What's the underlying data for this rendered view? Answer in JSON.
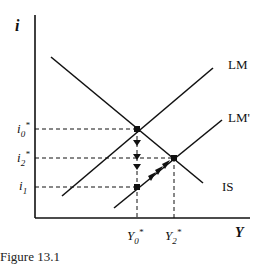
{
  "diagram": {
    "type": "IS-LM",
    "axes": {
      "y_label": "i",
      "x_label": "Y"
    },
    "curves": [
      {
        "name": "IS",
        "label": "IS"
      },
      {
        "name": "LM",
        "label": "LM"
      },
      {
        "name": "LM'",
        "label": "LM'"
      }
    ],
    "y_ticks": [
      {
        "base": "i",
        "sub": "0",
        "sup": "*"
      },
      {
        "base": "i",
        "sub": "2",
        "sup": "*"
      },
      {
        "base": "i",
        "sub": "1",
        "sup": ""
      }
    ],
    "x_ticks": [
      {
        "base": "Y",
        "sub": "0",
        "sup": "*"
      },
      {
        "base": "Y",
        "sub": "2",
        "sup": "*"
      }
    ],
    "points": [
      {
        "name": "initial-equilibrium",
        "at": "Y0*, i0*"
      },
      {
        "name": "new-equilibrium",
        "at": "Y2*, i2*"
      },
      {
        "name": "short-run-point",
        "at": "Y0*, i1"
      }
    ],
    "colors": {
      "ink": "#111111",
      "background": "#ffffff"
    },
    "caption": "Figure 13.1"
  }
}
